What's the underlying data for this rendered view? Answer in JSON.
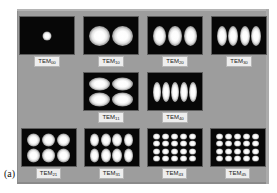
{
  "figure": {
    "panel_caption": "(a)",
    "background_color": "#9d9d9d",
    "frame_color": "#070707",
    "lobe_color": "#ffffff",
    "label_bg_color": "#eeeeee"
  },
  "chart_data": {
    "type": "table",
    "rows": [
      {
        "row_index": 1,
        "cells": [
          {
            "mode": "TEM",
            "m": "0",
            "n": "0",
            "label_prefix": "TEM",
            "label_sub": "00",
            "lobes_x": 1,
            "lobes_y": 1
          },
          {
            "mode": "TEM",
            "m": "1",
            "n": "0",
            "label_prefix": "TEM",
            "label_sub": "10",
            "lobes_x": 2,
            "lobes_y": 1
          },
          {
            "mode": "TEM",
            "m": "2",
            "n": "0",
            "label_prefix": "TEM",
            "label_sub": "20",
            "lobes_x": 3,
            "lobes_y": 1
          },
          {
            "mode": "TEM",
            "m": "3",
            "n": "0",
            "label_prefix": "TEM",
            "label_sub": "30",
            "lobes_x": 4,
            "lobes_y": 1
          }
        ]
      },
      {
        "row_index": 2,
        "cells": [
          {
            "mode": "TEM",
            "m": "1",
            "n": "1",
            "label_prefix": "TEM",
            "label_sub": "11",
            "lobes_x": 2,
            "lobes_y": 2
          },
          {
            "mode": "TEM",
            "m": "4",
            "n": "0",
            "label_prefix": "TEM",
            "label_sub": "40",
            "lobes_x": 5,
            "lobes_y": 1
          }
        ]
      },
      {
        "row_index": 3,
        "cells": [
          {
            "mode": "TEM",
            "m": "2",
            "n": "1",
            "label_prefix": "TEM",
            "label_sub": "21",
            "lobes_x": 3,
            "lobes_y": 2
          },
          {
            "mode": "TEM",
            "m": "3",
            "n": "1",
            "label_prefix": "TEM",
            "label_sub": "31",
            "lobes_x": 4,
            "lobes_y": 2
          },
          {
            "mode": "TEM",
            "m": "4",
            "n": "3",
            "label_prefix": "TEM",
            "label_sub": "43",
            "lobes_x": 5,
            "lobes_y": 4
          },
          {
            "mode": "TEM",
            "m": "4",
            "n": "5",
            "label_prefix": "TEM",
            "label_sub": "45",
            "lobes_x": 5,
            "lobes_y": 4
          }
        ]
      }
    ]
  }
}
